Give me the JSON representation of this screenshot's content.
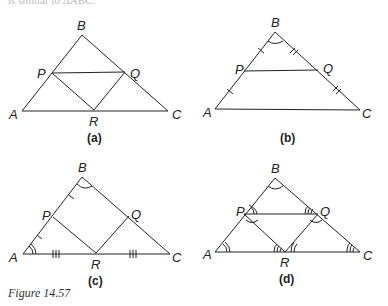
{
  "top_text": "is similar to ΔABC.",
  "figure_caption": "Figure 14.57",
  "panels": [
    {
      "id": "a",
      "caption": "(a)",
      "labels": {
        "A": "A",
        "B": "B",
        "C": "C",
        "P": "P",
        "Q": "Q",
        "R": "R"
      }
    },
    {
      "id": "b",
      "caption": "(b)",
      "labels": {
        "A": "A",
        "B": "B",
        "C": "C",
        "P": "P",
        "Q": "Q"
      }
    },
    {
      "id": "c",
      "caption": "(c)",
      "labels": {
        "A": "A",
        "B": "B",
        "C": "C",
        "P": "P",
        "Q": "Q",
        "R": "R"
      }
    },
    {
      "id": "d",
      "caption": "(d)",
      "labels": {
        "A": "A",
        "B": "B",
        "C": "C",
        "P": "P",
        "Q": "Q",
        "R": "R"
      }
    }
  ],
  "colors": {
    "stroke": "#222222",
    "background": "#ffffff"
  }
}
